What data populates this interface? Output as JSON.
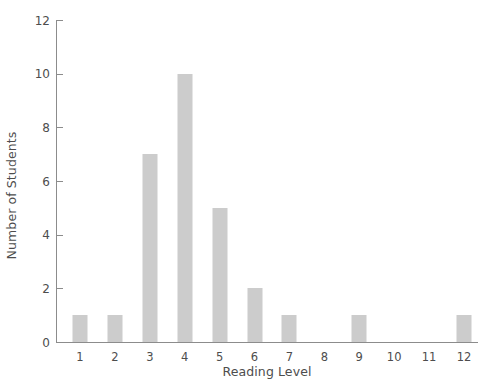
{
  "chart_data": {
    "type": "bar",
    "title": "",
    "subtitle": "",
    "xlabel": "Reading Level",
    "ylabel": "Number of Students",
    "categories": [
      "1",
      "2",
      "3",
      "4",
      "5",
      "6",
      "7",
      "8",
      "9",
      "10",
      "11",
      "12"
    ],
    "values": [
      1,
      1,
      7,
      10,
      5,
      2,
      1,
      0,
      1,
      0,
      0,
      1
    ],
    "series": [
      {
        "name": "Number of Students",
        "values": [
          1,
          1,
          7,
          10,
          5,
          2,
          1,
          0,
          1,
          0,
          0,
          1
        ]
      }
    ],
    "ylim": [
      0,
      12
    ],
    "ytick_labels": [
      "0",
      "2",
      "4",
      "6",
      "8",
      "10",
      "12"
    ],
    "ytick_values": [
      0,
      2,
      4,
      6,
      8,
      10,
      12
    ],
    "xtick_labels": [
      "1",
      "2",
      "3",
      "4",
      "5",
      "6",
      "7",
      "8",
      "9",
      "10",
      "11",
      "12"
    ],
    "grid": false,
    "legend": false,
    "legend_position": "none",
    "annotations": [],
    "colors": {
      "bar": "#cccccc",
      "axis": "#8c8c8c",
      "text": "#4d4d4d",
      "background": "#ffffff"
    }
  }
}
